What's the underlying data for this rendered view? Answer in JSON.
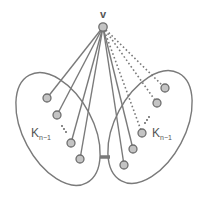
{
  "diagram": {
    "colors": {
      "stroke": "#7a7a7a",
      "node_fill": "#c4c4c4",
      "node_stroke": "#6e6e6e",
      "text": "#555555",
      "background": "#ffffff"
    },
    "apex": {
      "label": "v",
      "x": 103,
      "y": 27
    },
    "left_cluster": {
      "label_main": "K",
      "label_sub": "n−1",
      "ellipse": {
        "cx": 58,
        "cy": 129,
        "rx": 35,
        "ry": 61,
        "rotate": -28
      },
      "nodes": [
        {
          "x": 47,
          "y": 98
        },
        {
          "x": 57,
          "y": 115
        },
        {
          "x": 71,
          "y": 143
        },
        {
          "x": 80,
          "y": 159
        }
      ],
      "edge_style": "solid"
    },
    "right_cluster": {
      "label_main": "K",
      "label_sub": "n−1",
      "ellipse": {
        "cx": 150,
        "cy": 127,
        "rx": 35,
        "ry": 61,
        "rotate": 28
      },
      "nodes": [
        {
          "x": 165,
          "y": 88
        },
        {
          "x": 157,
          "y": 103
        },
        {
          "x": 142,
          "y": 133
        },
        {
          "x": 133,
          "y": 149
        },
        {
          "x": 124,
          "y": 165
        }
      ],
      "solid_edges_to": [
        3,
        4
      ],
      "dotted_edges_to": [
        0,
        1,
        2
      ]
    },
    "bridge": {
      "x1": 100,
      "y1": 157,
      "x2": 110,
      "y2": 157
    }
  }
}
